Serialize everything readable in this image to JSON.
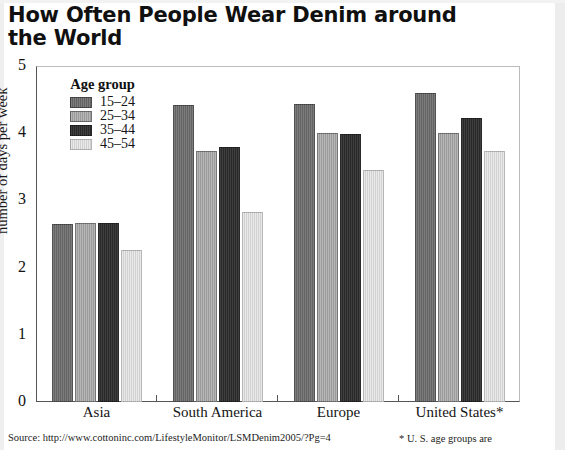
{
  "title": "How Often People Wear Denim around\nthe World",
  "legend": {
    "title": "Age group",
    "items": [
      {
        "label": "15–24",
        "color": "#6e6e6e"
      },
      {
        "label": "25–34",
        "color": "#a8a8a8"
      },
      {
        "label": "35–44",
        "color": "#2f2f2f"
      },
      {
        "label": "45–54",
        "color": "#e2e2e2"
      }
    ]
  },
  "footer": {
    "source": "Source: http://www.cottoninc.com/LifestyleMonitor/LSMDenim2005/?Pg=4",
    "asterisk_note": "* U. S. age groups are"
  },
  "chart_data": {
    "type": "bar",
    "title": "How Often People Wear Denim around the World",
    "xlabel": "",
    "ylabel": "number of days per week",
    "ylim": [
      0,
      5
    ],
    "yticks": [
      0,
      1,
      2,
      3,
      4,
      5
    ],
    "grid": false,
    "legend_position": "top-left inside",
    "categories": [
      "Asia",
      "South America",
      "Europe",
      "United States*"
    ],
    "series": [
      {
        "name": "15–24",
        "color": "#6e6e6e",
        "values": [
          2.65,
          4.42,
          4.43,
          4.6
        ]
      },
      {
        "name": "25–34",
        "color": "#a8a8a8",
        "values": [
          2.67,
          3.74,
          4.0,
          4.01
        ]
      },
      {
        "name": "35–44",
        "color": "#2f2f2f",
        "values": [
          2.66,
          3.79,
          3.99,
          4.23
        ]
      },
      {
        "name": "45–54",
        "color": "#e2e2e2",
        "values": [
          2.26,
          2.83,
          3.45,
          3.73
        ]
      }
    ]
  }
}
